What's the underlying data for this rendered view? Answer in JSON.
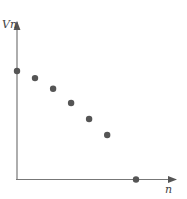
{
  "chart_data": {
    "type": "scatter",
    "title": "",
    "xlabel": "n",
    "ylabel": "Vn",
    "grid": false,
    "legend": null,
    "axis_style": "arrowed axes from origin, no ticks",
    "points_pixel": [
      [
        17,
        71
      ],
      [
        35,
        78
      ],
      [
        52,
        88
      ],
      [
        70,
        102
      ],
      [
        88,
        118
      ],
      [
        106,
        133
      ],
      [
        136,
        179
      ]
    ],
    "x": [
      0,
      1,
      2,
      3,
      4,
      5,
      6.6
    ],
    "y": [
      6.1,
      5.7,
      5.1,
      4.3,
      3.4,
      2.5,
      0
    ],
    "xlim": [
      0,
      8.8
    ],
    "ylim": [
      0,
      8.7
    ],
    "point_color": "#555555",
    "axis_color": "#777777"
  },
  "labels": {
    "y_axis": "Vn",
    "x_axis": "n"
  }
}
